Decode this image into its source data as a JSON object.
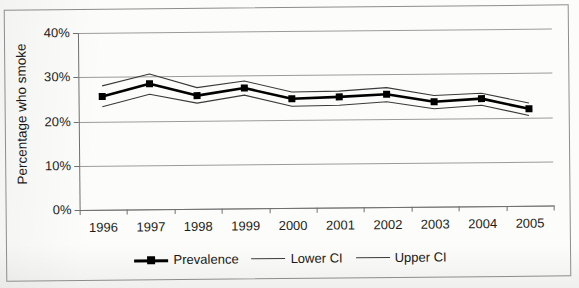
{
  "chart_data": {
    "type": "line",
    "title": "",
    "xlabel": "",
    "ylabel": "Percentage who smoke",
    "categories": [
      "1996",
      "1997",
      "1998",
      "1999",
      "2000",
      "2001",
      "2002",
      "2003",
      "2004",
      "2005"
    ],
    "ylim": [
      0,
      40
    ],
    "yticks": [
      "0%",
      "10%",
      "20%",
      "30%",
      "40%"
    ],
    "ytick_values": [
      0,
      10,
      20,
      30,
      40
    ],
    "ytick_suffix": "%",
    "grid": true,
    "grid_axis": "y",
    "legend_position": "bottom",
    "series": [
      {
        "name": "Prevalence",
        "style": "line-marker",
        "marker": "square",
        "color": "#000000",
        "width": 2.6,
        "values": [
          25.6,
          28.4,
          25.6,
          27.2,
          24.7,
          25.0,
          25.5,
          23.7,
          24.3,
          21.9
        ]
      },
      {
        "name": "Lower CI",
        "style": "line",
        "marker": "none",
        "color": "#3a3a3a",
        "width": 1.1,
        "values": [
          23.3,
          26.0,
          23.9,
          25.6,
          23.0,
          23.1,
          23.8,
          22.1,
          22.8,
          20.4
        ]
      },
      {
        "name": "Upper CI",
        "style": "line",
        "marker": "none",
        "color": "#3a3a3a",
        "width": 1.1,
        "values": [
          28.0,
          30.6,
          27.4,
          28.8,
          26.2,
          26.3,
          27.0,
          25.1,
          25.5,
          23.2
        ]
      }
    ]
  },
  "legend": {
    "items": [
      {
        "label": "Prevalence"
      },
      {
        "label": "Lower CI"
      },
      {
        "label": "Upper CI"
      }
    ]
  },
  "axis": {
    "y_title": "Percentage who smoke"
  }
}
